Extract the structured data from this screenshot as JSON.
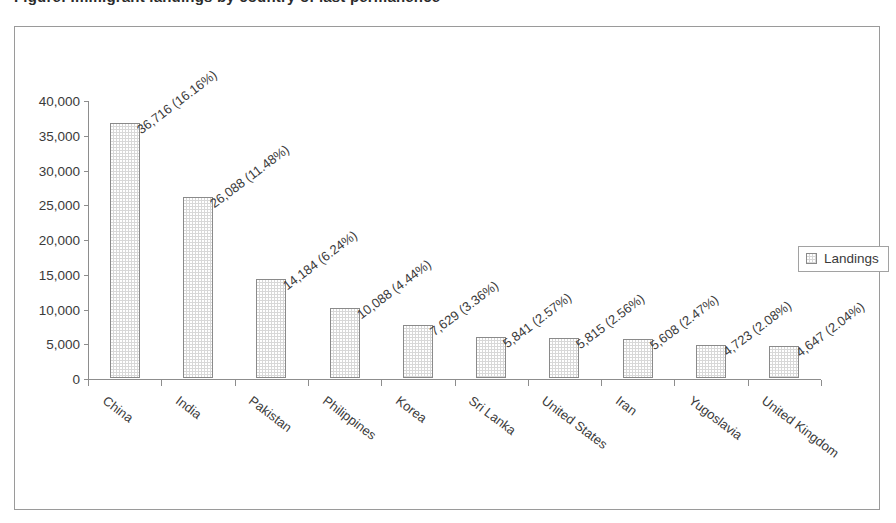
{
  "title": "Figure: Immigrant landings by country of last permanence",
  "legend": {
    "label": "Landings",
    "position": "right"
  },
  "chart_data": {
    "type": "bar",
    "title": "",
    "xlabel": "",
    "ylabel": "",
    "ylim": [
      0,
      40000
    ],
    "ytick_labels": [
      "40,000",
      "35,000",
      "30,000",
      "25,000",
      "20,000",
      "15,000",
      "10,000",
      "5,000",
      "0"
    ],
    "ytick_values": [
      40000,
      35000,
      30000,
      25000,
      20000,
      15000,
      10000,
      5000,
      0
    ],
    "grid": false,
    "series": [
      {
        "name": "Landings",
        "values": [
          36716,
          26088,
          14184,
          10088,
          7629,
          5841,
          5815,
          5608,
          4723,
          4647
        ]
      }
    ],
    "categories": [
      "China",
      "India",
      "Pakistan",
      "Philippines",
      "Korea",
      "Sri Lanka",
      "United States",
      "Iran",
      "Yugoslavia",
      "United Kingdom"
    ],
    "percents": [
      "16.16%",
      "11.48%",
      "6.24%",
      "4.44%",
      "3.36%",
      "2.57%",
      "2.56%",
      "2.47%",
      "2.08%",
      "2.04%"
    ],
    "data_labels": [
      "36,716 (16.16%)",
      "26,088 (11.48%)",
      "14,184 (6.24%)",
      "10,088 (4.44%)",
      "7,629 (3.36%)",
      "5,841 (2.57%)",
      "5,815 (2.56%)",
      "5,608 (2.47%)",
      "4,723 (2.08%)",
      "4,647 (2.04%)"
    ],
    "colors": {
      "bar_fill": "#d8d8d8",
      "bar_border": "#8a8a8a",
      "axis": "#8d8d8d",
      "text": "#3a3a3a",
      "background": "#ffffff"
    }
  }
}
